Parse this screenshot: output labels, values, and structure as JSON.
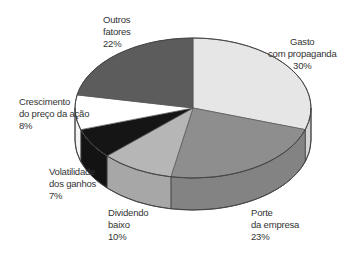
{
  "chart_data": {
    "type": "pie",
    "style": "3d",
    "title": "",
    "categories": [
      "Gasto com propaganda",
      "Porte da empresa",
      "Dividendo baixo",
      "Volatilidade dos ganhos",
      "Crescimento do preço da ação",
      "Outros fatores"
    ],
    "values": [
      30,
      23,
      10,
      7,
      8,
      22
    ],
    "unit": "%",
    "colors": [
      "#e6e6e6",
      "#8e8e8e",
      "#b6b6b6",
      "#151515",
      "#ffffff",
      "#5c5c5c"
    ],
    "start_angle_deg": 0,
    "direction": "clockwise"
  },
  "labels": [
    {
      "lines": [
        "Gasto",
        "com propaganda",
        "30%"
      ]
    },
    {
      "lines": [
        "Porte",
        "da empresa",
        "23%"
      ]
    },
    {
      "lines": [
        "Dividendo",
        "baixo",
        "10%"
      ]
    },
    {
      "lines": [
        "Volatilidade",
        "dos ganhos",
        "7%"
      ]
    },
    {
      "lines": [
        "Crescimento",
        "do preço da ação",
        "8%"
      ]
    },
    {
      "lines": [
        "Outros",
        "fatores",
        "22%"
      ]
    }
  ]
}
